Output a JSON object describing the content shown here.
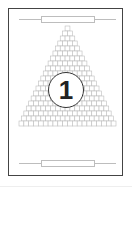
{
  "card": {
    "number": "1",
    "pyramid_rows": 20,
    "colors": {
      "border": "#444444",
      "grid": "#bdbdbd",
      "circle": "#333333"
    }
  }
}
